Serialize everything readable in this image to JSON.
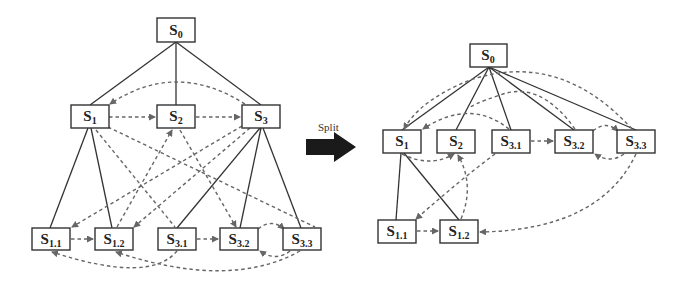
{
  "figure": {
    "split_label": "Split",
    "colors": {
      "node_border": "#333333",
      "tree_edge": "#333333",
      "dependency_edge": "#666666",
      "arrow": "#1a1a1a"
    }
  },
  "left_graph": {
    "nodes": [
      {
        "id": "S0",
        "base": "S",
        "sub": "0"
      },
      {
        "id": "S1",
        "base": "S",
        "sub": "1"
      },
      {
        "id": "S2",
        "base": "S",
        "sub": "2"
      },
      {
        "id": "S3",
        "base": "S",
        "sub": "3"
      },
      {
        "id": "S1.1",
        "base": "S",
        "sub": "1.1"
      },
      {
        "id": "S1.2",
        "base": "S",
        "sub": "1.2"
      },
      {
        "id": "S3.1",
        "base": "S",
        "sub": "3.1"
      },
      {
        "id": "S3.2",
        "base": "S",
        "sub": "3.2"
      },
      {
        "id": "S3.3",
        "base": "S",
        "sub": "3.3"
      }
    ],
    "tree_edges": [
      [
        "S0",
        "S1"
      ],
      [
        "S0",
        "S2"
      ],
      [
        "S0",
        "S3"
      ],
      [
        "S1",
        "S1.1"
      ],
      [
        "S1",
        "S1.2"
      ],
      [
        "S3",
        "S3.1"
      ],
      [
        "S3",
        "S3.2"
      ],
      [
        "S3",
        "S3.3"
      ]
    ],
    "dependency_edges": [
      [
        "S1",
        "S2"
      ],
      [
        "S2",
        "S3"
      ],
      [
        "S3",
        "S1"
      ],
      [
        "S1.1",
        "S1.2"
      ],
      [
        "S3.1",
        "S3.2"
      ],
      [
        "S3.2",
        "S3.3"
      ],
      [
        "S3.3",
        "S3.2"
      ],
      [
        "S3.1",
        "S1.1"
      ],
      [
        "S3.3",
        "S1.2"
      ]
    ]
  },
  "right_graph": {
    "nodes": [
      {
        "id": "S0",
        "base": "S",
        "sub": "0"
      },
      {
        "id": "S1",
        "base": "S",
        "sub": "1"
      },
      {
        "id": "S2",
        "base": "S",
        "sub": "2"
      },
      {
        "id": "S3.1",
        "base": "S",
        "sub": "3.1"
      },
      {
        "id": "S3.2",
        "base": "S",
        "sub": "3.2"
      },
      {
        "id": "S3.3",
        "base": "S",
        "sub": "3.3"
      },
      {
        "id": "S1.1",
        "base": "S",
        "sub": "1.1"
      },
      {
        "id": "S1.2",
        "base": "S",
        "sub": "1.2"
      }
    ],
    "tree_edges": [
      [
        "S0",
        "S1"
      ],
      [
        "S0",
        "S2"
      ],
      [
        "S0",
        "S3.1"
      ],
      [
        "S0",
        "S3.2"
      ],
      [
        "S0",
        "S3.3"
      ],
      [
        "S1",
        "S1.1"
      ],
      [
        "S1",
        "S1.2"
      ]
    ],
    "dependency_edges": [
      [
        "S1",
        "S2"
      ],
      [
        "S3.1",
        "S3.2"
      ],
      [
        "S3.2",
        "S3.3"
      ],
      [
        "S3.3",
        "S3.2"
      ],
      [
        "S1.1",
        "S1.2"
      ],
      [
        "S3.1",
        "S1.1"
      ],
      [
        "S3.3",
        "S1.2"
      ],
      [
        "S3.3",
        "S1"
      ]
    ]
  }
}
